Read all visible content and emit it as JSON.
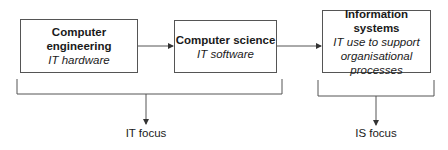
{
  "boxes": [
    {
      "title": "Computer engineering",
      "subtitle": [
        "IT hardware"
      ]
    },
    {
      "title": "Computer science",
      "subtitle": [
        "IT software"
      ]
    },
    {
      "title": "Information systems",
      "subtitle": [
        "IT use to support",
        "organisational",
        "processes"
      ]
    }
  ],
  "groups": [
    {
      "label": "IT focus"
    },
    {
      "label": "IS focus"
    }
  ],
  "colors": {
    "line": "#555555",
    "text": "#1a1a1a"
  }
}
